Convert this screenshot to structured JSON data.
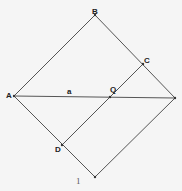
{
  "diagram": {
    "title": "",
    "background": "#f5f5f5",
    "line_color": "#555555",
    "points": {
      "B": {
        "label": "B",
        "x": 95,
        "y": 15
      },
      "A": {
        "label": "A",
        "x": 14,
        "y": 96
      },
      "R": {
        "label": "",
        "x": 175,
        "y": 98
      },
      "E": {
        "label": "",
        "x": 95,
        "y": 177
      },
      "C": {
        "label": "C",
        "x": 143,
        "y": 64
      },
      "Q": {
        "label": "Q",
        "x": 110,
        "y": 97
      },
      "D": {
        "label": "D",
        "x": 62,
        "y": 145
      }
    },
    "segment_labels": {
      "a": "a",
      "one": "1"
    },
    "edges": [
      [
        "A",
        "B"
      ],
      [
        "B",
        "R"
      ],
      [
        "R",
        "E"
      ],
      [
        "E",
        "A"
      ],
      [
        "A",
        "R"
      ],
      [
        "C",
        "D"
      ]
    ]
  }
}
